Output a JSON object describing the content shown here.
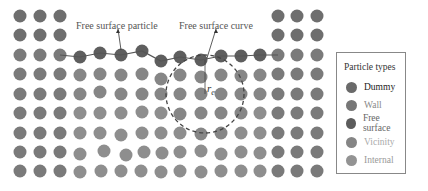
{
  "colors": {
    "dummy": "#6e6e6e",
    "wall": "#7a7a7a",
    "free_surface": "#5e5e5e",
    "vicinity": "#868686",
    "internal": "#8e8e8e",
    "curve": "#555555",
    "background": "#ffffff"
  },
  "annotations": {
    "free_surface_particle": "Free surface particle",
    "free_surface_curve": "Free surface curve",
    "radius_symbol": "r",
    "radius_subscript": "e"
  },
  "legend": {
    "title": "Particle types",
    "items": [
      {
        "label": "Dummy",
        "color": "#6a6a6a",
        "text_color": "#222222"
      },
      {
        "label": "Wall",
        "color": "#777777",
        "text_color": "#888888"
      },
      {
        "label": "Free surface",
        "color": "#5c5c5c",
        "text_color": "#666666"
      },
      {
        "label": "Vicinity",
        "color": "#858585",
        "text_color": "#aaaaaa"
      },
      {
        "label": "Internal",
        "color": "#939393",
        "text_color": "#999999"
      }
    ]
  },
  "particles": {
    "dummy_left": {
      "xs": [
        20,
        40,
        60
      ],
      "ys": [
        16,
        35,
        55,
        74,
        94,
        113,
        133,
        152,
        171
      ]
    },
    "dummy_right": {
      "xs": [
        278,
        297,
        317
      ],
      "ys": [
        16,
        35,
        55,
        74,
        94,
        113,
        133,
        152,
        171
      ]
    },
    "free_surface": [
      [
        80,
        57
      ],
      [
        100,
        53
      ],
      [
        121,
        55
      ],
      [
        142,
        51
      ],
      [
        161,
        61
      ],
      [
        180,
        57
      ],
      [
        201,
        60
      ],
      [
        221,
        56
      ],
      [
        241,
        56
      ],
      [
        260,
        55
      ]
    ],
    "interior_rows": [
      {
        "y": 75,
        "xs": [
          80,
          100,
          121,
          142,
          161,
          180,
          201,
          221,
          241,
          260
        ],
        "shifts": [
          0,
          -1,
          0,
          -1,
          4,
          0,
          2,
          0,
          1,
          0
        ]
      },
      {
        "y": 94,
        "xs": [
          80,
          100,
          121,
          142,
          161,
          180,
          201,
          221,
          241,
          260
        ],
        "shifts": [
          0,
          -2,
          0,
          0,
          0,
          0,
          0,
          0,
          0,
          0
        ]
      },
      {
        "y": 113,
        "xs": [
          80,
          100,
          121,
          142,
          161,
          180,
          201,
          221,
          241,
          260
        ],
        "shifts": [
          0,
          0,
          0,
          -1,
          0,
          1,
          0,
          0,
          0,
          0
        ]
      },
      {
        "y": 133,
        "xs": [
          80,
          100,
          121,
          142,
          161,
          180,
          201,
          221,
          241,
          260
        ],
        "shifts": [
          0,
          0,
          2,
          0,
          0,
          0,
          1,
          0,
          0,
          0
        ]
      },
      {
        "y": 152,
        "xs": [
          80,
          104,
          126,
          144,
          162,
          180,
          201,
          221,
          241,
          260
        ],
        "shifts": [
          2,
          -1,
          3,
          0,
          1,
          0,
          -1,
          2,
          0,
          1
        ]
      },
      {
        "y": 171,
        "xs": [
          80,
          101,
          121,
          141,
          161,
          180,
          201,
          221,
          241,
          260
        ],
        "shifts": [
          1,
          0,
          0,
          0,
          1,
          0,
          1,
          0,
          0,
          0
        ]
      }
    ]
  },
  "circle": {
    "cx": 205,
    "cy": 94,
    "r": 39
  }
}
